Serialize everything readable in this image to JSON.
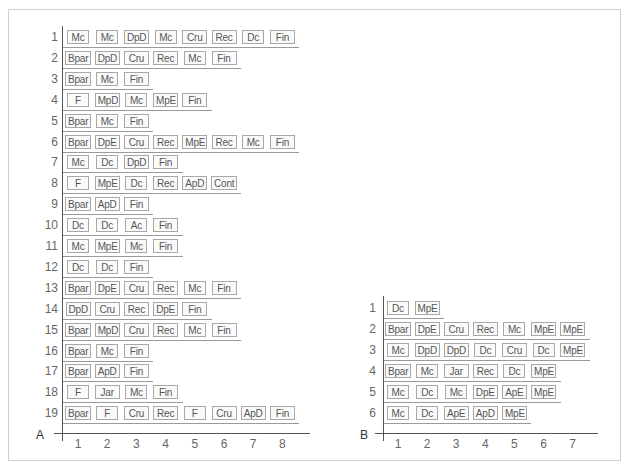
{
  "panels": [
    {
      "label": "A",
      "x_ticks": [
        "1",
        "2",
        "3",
        "4",
        "5",
        "6",
        "7",
        "8"
      ],
      "rows": [
        {
          "n": "1",
          "items": [
            "Mc",
            "Mc",
            "DpD",
            "Mc",
            "Cru",
            "Rec",
            "Dc",
            "Fin"
          ]
        },
        {
          "n": "2",
          "items": [
            "Bpar",
            "DpD",
            "Cru",
            "Rec",
            "Mc",
            "Fin"
          ]
        },
        {
          "n": "3",
          "items": [
            "Bpar",
            "Mc",
            "Fin"
          ]
        },
        {
          "n": "4",
          "items": [
            "F",
            "MpD",
            "Mc",
            "MpE",
            "Fin"
          ]
        },
        {
          "n": "5",
          "items": [
            "Bpar",
            "Mc",
            "Fin"
          ]
        },
        {
          "n": "6",
          "items": [
            "Bpar",
            "DpE",
            "Cru",
            "Rec",
            "MpE",
            "Rec",
            "Mc",
            "Fin"
          ]
        },
        {
          "n": "7",
          "items": [
            "Mc",
            "Dc",
            "DpD",
            "Fin"
          ]
        },
        {
          "n": "8",
          "items": [
            "F",
            "MpE",
            "Dc",
            "Rec",
            "ApD",
            "Cont"
          ]
        },
        {
          "n": "9",
          "items": [
            "Bpar",
            "ApD",
            "Fin"
          ]
        },
        {
          "n": "10",
          "items": [
            "Dc",
            "Dc",
            "Ac",
            "Fin"
          ]
        },
        {
          "n": "11",
          "items": [
            "Mc",
            "MpE",
            "Mc",
            "Fin"
          ]
        },
        {
          "n": "12",
          "items": [
            "Dc",
            "Dc",
            "Fin"
          ]
        },
        {
          "n": "13",
          "items": [
            "Bpar",
            "DpE",
            "Cru",
            "Rec",
            "Mc",
            "Fin"
          ]
        },
        {
          "n": "14",
          "items": [
            "DpD",
            "Cru",
            "Rec",
            "DpE",
            "Fin"
          ]
        },
        {
          "n": "15",
          "items": [
            "Bpar",
            "MpD",
            "Cru",
            "Rec",
            "Mc",
            "Fin"
          ]
        },
        {
          "n": "16",
          "items": [
            "Bpar",
            "Mc",
            "Fin"
          ]
        },
        {
          "n": "17",
          "items": [
            "Bpar",
            "ApD",
            "Fin"
          ]
        },
        {
          "n": "18",
          "items": [
            "F",
            "Jar",
            "Mc",
            "Fin"
          ]
        },
        {
          "n": "19",
          "items": [
            "Bpar",
            "F",
            "Cru",
            "Rec",
            "F",
            "Cru",
            "ApD",
            "Fin"
          ]
        }
      ]
    },
    {
      "label": "B",
      "x_ticks": [
        "1",
        "2",
        "3",
        "4",
        "5",
        "6",
        "7"
      ],
      "rows": [
        {
          "n": "1",
          "items": [
            "Dc",
            "MpE"
          ]
        },
        {
          "n": "2",
          "items": [
            "Bpar",
            "DpE",
            "Cru",
            "Rec",
            "Mc",
            "MpE",
            "MpE"
          ]
        },
        {
          "n": "3",
          "items": [
            "Mc",
            "DpD",
            "DpD",
            "Dc",
            "Cru",
            "Dc",
            "MpE"
          ]
        },
        {
          "n": "4",
          "items": [
            "Bpar",
            "Mc",
            "Jar",
            "Rec",
            "Dc",
            "MpE"
          ]
        },
        {
          "n": "5",
          "items": [
            "Mc",
            "Dc",
            "Mc",
            "DpE",
            "ApE",
            "MpE"
          ]
        },
        {
          "n": "6",
          "items": [
            "Mc",
            "Dc",
            "ApE",
            "ApD",
            "MpE"
          ]
        }
      ]
    }
  ]
}
